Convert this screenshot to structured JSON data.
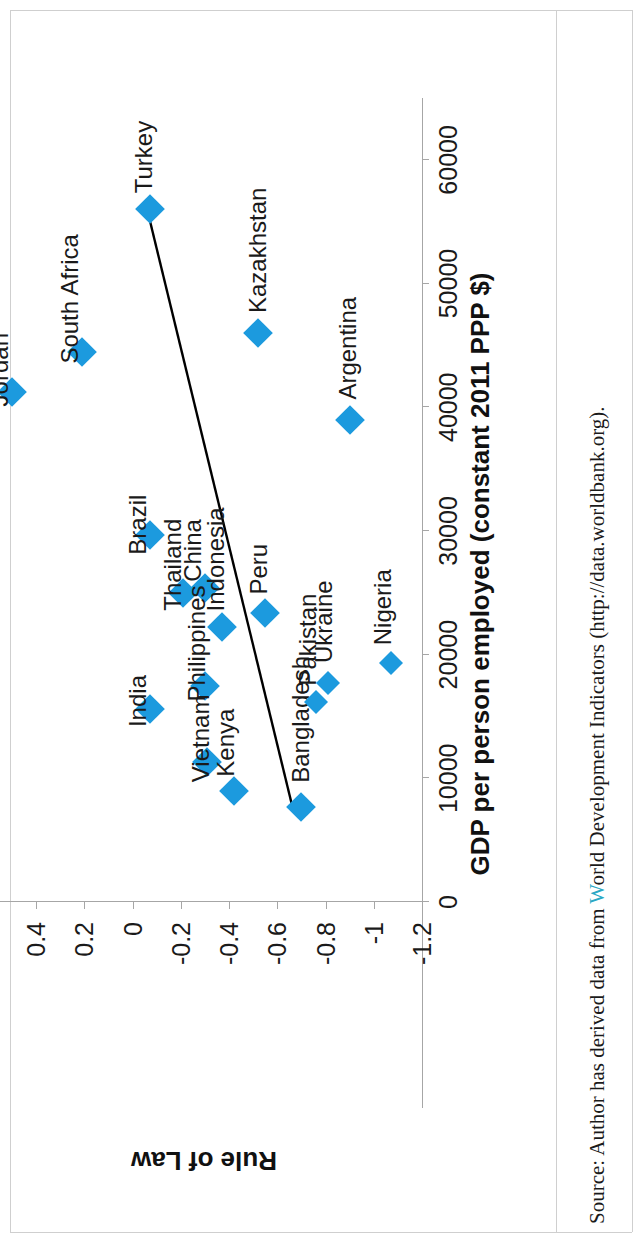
{
  "figure": {
    "source_note_prefix": "Source: Author has derived data from ",
    "source_note_highlight": "W",
    "source_note_rest": "orld Development Indicators (http://data.worldbank.org)."
  },
  "chart_data": {
    "type": "scatter",
    "title": "",
    "xlabel": "GDP per person employed (constant 2011 PPP $)",
    "ylabel": "Rule of Law",
    "xlim": [
      0,
      65000
    ],
    "ylim": [
      -1.2,
      0.6
    ],
    "grid": false,
    "legend": "none",
    "orientation": "rotated-90-ccw",
    "marker_color": "#1c9ade",
    "trendline_color": "#000000",
    "xticks": [
      0,
      10000,
      20000,
      30000,
      40000,
      50000,
      60000
    ],
    "xticklabels": [
      "0",
      "10000",
      "20000",
      "30000",
      "40000",
      "50000",
      "60000"
    ],
    "yticks": [
      0.6,
      0.4,
      0.2,
      0,
      -0.2,
      -0.4,
      -0.6,
      -0.8,
      -1,
      -1.2
    ],
    "yticklabels": [
      "0.6",
      "0.4",
      "0.2",
      "0",
      "-0.2",
      "-0.4",
      "-0.6",
      "-0.8",
      "-1",
      "-1.2"
    ],
    "points": [
      {
        "label": "Turkey",
        "x": 56000,
        "y": -0.07
      },
      {
        "label": "Jordan",
        "x": 41200,
        "y": 0.5
      },
      {
        "label": "South Africa",
        "x": 44500,
        "y": 0.21
      },
      {
        "label": "Kazakhstan",
        "x": 46000,
        "y": -0.52
      },
      {
        "label": "Brazil",
        "x": 29700,
        "y": -0.07
      },
      {
        "label": "Argentina",
        "x": 39000,
        "y": -0.9
      },
      {
        "label": "Thailand",
        "x": 25000,
        "y": -0.21
      },
      {
        "label": "China",
        "x": 25400,
        "y": -0.3
      },
      {
        "label": "Indonesia",
        "x": 22200,
        "y": -0.37
      },
      {
        "label": "Peru",
        "x": 23400,
        "y": -0.55
      },
      {
        "label": "India",
        "x": 15600,
        "y": -0.07
      },
      {
        "label": "Philippines",
        "x": 17500,
        "y": -0.3
      },
      {
        "label": "Vietnam",
        "x": 11300,
        "y": -0.31
      },
      {
        "label": "Kenya",
        "x": 9000,
        "y": -0.42
      },
      {
        "label": "Bangladesh",
        "x": 7700,
        "y": -0.7
      },
      {
        "label": "Pakistan",
        "x": 16200,
        "y": -0.76
      },
      {
        "label": "Ukraine",
        "x": 17700,
        "y": -0.81
      },
      {
        "label": "Nigeria",
        "x": 19300,
        "y": -1.07
      }
    ],
    "trendline": {
      "x_start": 7500,
      "y_start": -0.665,
      "x_end": 56000,
      "y_end": -0.06
    }
  }
}
